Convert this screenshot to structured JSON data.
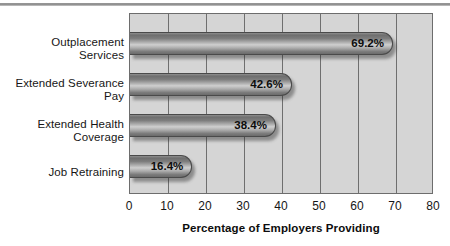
{
  "chart_data": {
    "type": "bar",
    "orientation": "horizontal",
    "title": "",
    "xlabel": "Percentage of Employers Providing",
    "ylabel": "",
    "xlim": [
      0,
      80
    ],
    "xticks": [
      "0",
      "10",
      "20",
      "30",
      "40",
      "50",
      "60",
      "70",
      "80"
    ],
    "grid": true,
    "legend": null,
    "categories": [
      "Outplacement Services",
      "Extended Severance Pay",
      "Extended Health Coverage",
      "Job Retraining"
    ],
    "category_lines": [
      [
        "Outplacement",
        "Services"
      ],
      [
        "Extended Severance",
        "Pay"
      ],
      [
        "Extended Health",
        "Coverage"
      ],
      [
        "Job Retraining"
      ]
    ],
    "values": [
      69.2,
      42.6,
      38.4,
      16.4
    ],
    "value_labels": [
      "69.2%",
      "42.6%",
      "38.4%",
      "16.4%"
    ],
    "colors": {
      "plot_background": "#d5d5d5",
      "gridline": "#6f6f6f",
      "frame": "#6d6d6d",
      "bar_light": "#cfcfcf",
      "bar_dark": "#6b6b6b",
      "text": "#161616",
      "page_background": "#ffffff",
      "top_rule": "#8c8c8c"
    }
  }
}
